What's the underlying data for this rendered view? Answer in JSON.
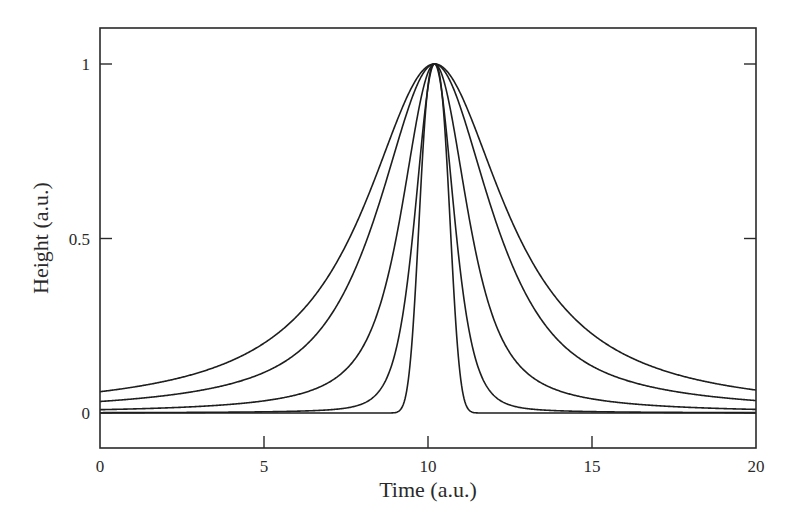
{
  "chart_data": {
    "type": "line",
    "title": "",
    "xlabel": "Time (a.u.)",
    "ylabel": "Height (a.u.)",
    "xlim": [
      0,
      20
    ],
    "ylim": [
      -0.2,
      1.12
    ],
    "xticks": [
      0,
      5,
      10,
      15,
      20
    ],
    "xtick_labels": [
      "0",
      "5",
      "10",
      "15",
      "20"
    ],
    "yticks": [
      0,
      0.5,
      1
    ],
    "ytick_labels": [
      "0",
      "0.5",
      "1"
    ],
    "grid": false,
    "legend": null,
    "line_color": "#1e1e1e",
    "peak_center": 10.2,
    "series": [
      {
        "name": "curve-1",
        "shape": "lorentzian",
        "hwhm": 2.6,
        "x": [
          0,
          2,
          4,
          6,
          8,
          9,
          10.2,
          11.4,
          12.4,
          14.4,
          16.4,
          18.4,
          20
        ],
        "values": [
          0.06,
          0.09,
          0.15,
          0.28,
          0.58,
          0.82,
          1.0,
          0.82,
          0.58,
          0.28,
          0.15,
          0.09,
          0.066
        ]
      },
      {
        "name": "curve-2",
        "shape": "lorentzian-mix",
        "hwhm": 2.05,
        "x": [
          0,
          2,
          4,
          6,
          8,
          9,
          10.2,
          11.4,
          12.4,
          14.4,
          16.4,
          18.4,
          20
        ],
        "values": [
          0.035,
          0.055,
          0.09,
          0.18,
          0.45,
          0.74,
          1.0,
          0.74,
          0.45,
          0.18,
          0.09,
          0.055,
          0.04
        ]
      },
      {
        "name": "curve-3",
        "shape": "mixed",
        "hwhm": 1.5,
        "x": [
          0,
          2,
          4,
          6,
          8,
          9,
          10.2,
          11.4,
          12.4,
          14.4,
          16.4,
          18.4,
          20
        ],
        "values": [
          0.013,
          0.02,
          0.035,
          0.08,
          0.3,
          0.6,
          1.0,
          0.6,
          0.3,
          0.08,
          0.035,
          0.02,
          0.015
        ]
      },
      {
        "name": "curve-4",
        "shape": "sech-like",
        "hwhm": 0.98,
        "x": [
          0,
          2,
          4,
          6,
          8,
          9,
          10.2,
          11.4,
          12.4,
          14.4,
          16.4,
          18.4,
          20
        ],
        "values": [
          0.002,
          0.004,
          0.008,
          0.02,
          0.11,
          0.35,
          1.0,
          0.35,
          0.11,
          0.02,
          0.008,
          0.004,
          0.003
        ]
      },
      {
        "name": "curve-5",
        "shape": "gaussian",
        "hwhm": 0.5,
        "x": [
          0,
          2,
          4,
          6,
          8,
          9,
          10.2,
          11.4,
          12.4,
          14.4,
          16.4,
          18.4,
          20
        ],
        "values": [
          0,
          0,
          0,
          0,
          0,
          0.0,
          1.0,
          0.0,
          0,
          0,
          0,
          0,
          0
        ]
      }
    ]
  },
  "axes": {
    "xlabel": "Time (a.u.)",
    "ylabel": "Height (a.u.)"
  }
}
